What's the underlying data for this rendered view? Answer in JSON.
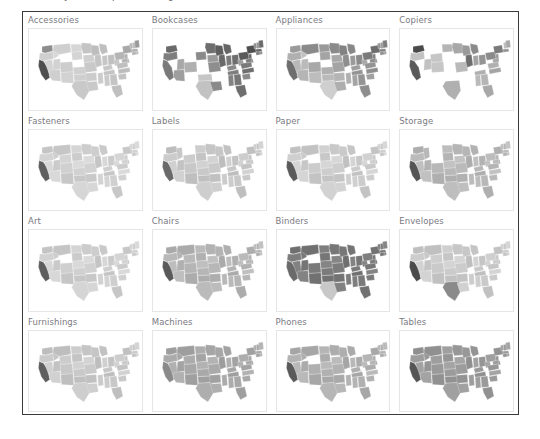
{
  "title_remnant": {
    "fragments": [
      "y",
      "p",
      "g"
    ]
  },
  "grid": {
    "rows": 4,
    "columns": 4,
    "panel_border_color": "#e6e6e8",
    "frame_border_color": "#3a3a3a",
    "label_color": "#7a7a82",
    "background": "#ffffff"
  },
  "chart_data": {
    "type": "heatmap",
    "title": "",
    "subtitle": "",
    "xlabel": "",
    "ylabel": "",
    "layout": "4x4 trellis of US state choropleth maps (small multiples)",
    "legend": "none",
    "grid": false,
    "geography": "United States (contiguous 48 states)",
    "color_scale": {
      "type": "sequential-gray",
      "low": "#e8e8e8",
      "mid": "#b4b4b4",
      "high": "#4a4a4a",
      "absent": "#ffffff",
      "absent_meaning": "no data / state not present in sub-category"
    },
    "categories": [
      "Accessories",
      "Bookcases",
      "Appliances",
      "Copiers",
      "Fasteners",
      "Labels",
      "Paper",
      "Storage",
      "Art",
      "Chairs",
      "Binders",
      "Envelopes",
      "Furnishings",
      "Machines",
      "Phones",
      "Tables"
    ],
    "panels": [
      {
        "label": "Accessories",
        "row": 1,
        "column": 1,
        "coverage": "near-complete",
        "overall_shade": "light",
        "notes": "most states light gray; California dark; Washington medium-dark; Wyoming absent (white); Nebraska light"
      },
      {
        "label": "Bookcases",
        "row": 1,
        "column": 2,
        "coverage": "sparse",
        "overall_shade": "dark",
        "notes": "many western/plains states absent; Washington, Oregon, California dark; Texas light; Midwest and East dark"
      },
      {
        "label": "Appliances",
        "row": 1,
        "column": 3,
        "coverage": "mostly complete",
        "overall_shade": "medium",
        "notes": "California and Montana medium-dark; a few interior states absent; Midwest dark; Southeast medium"
      },
      {
        "label": "Copiers",
        "row": 1,
        "column": 4,
        "coverage": "very sparse",
        "overall_shade": "mixed",
        "notes": "disconnected states only; Washington and California dark; Texas and Florida medium; large gaps in plains and south"
      },
      {
        "label": "Fasteners",
        "row": 2,
        "column": 1,
        "coverage": "near-complete",
        "overall_shade": "light",
        "notes": "California dark; remainder mostly uniform light gray"
      },
      {
        "label": "Labels",
        "row": 2,
        "column": 2,
        "coverage": "near-complete",
        "overall_shade": "light-medium",
        "notes": "California dark; Montana absent; eastern states medium"
      },
      {
        "label": "Paper",
        "row": 2,
        "column": 3,
        "coverage": "complete",
        "overall_shade": "light",
        "notes": "California dark; Wyoming absent; broadly uniform light shading"
      },
      {
        "label": "Storage",
        "row": 2,
        "column": 4,
        "coverage": "complete",
        "overall_shade": "medium",
        "notes": "California dark; Montana/Wyoming absent; eastern half medium gray"
      },
      {
        "label": "Art",
        "row": 3,
        "column": 1,
        "coverage": "near-complete",
        "overall_shade": "light",
        "notes": "California dark; Wyoming absent; mostly light gray"
      },
      {
        "label": "Chairs",
        "row": 3,
        "column": 2,
        "coverage": "complete",
        "overall_shade": "medium",
        "notes": "California dark; interior medium gray; eastern states medium-dark"
      },
      {
        "label": "Binders",
        "row": 3,
        "column": 3,
        "coverage": "complete",
        "overall_shade": "dark",
        "notes": "darkest panel overall; Wyoming absent (white); Texas notably light against dark surroundings"
      },
      {
        "label": "Envelopes",
        "row": 3,
        "column": 4,
        "coverage": "sparse",
        "overall_shade": "light",
        "notes": "California dark; Texas dark; several plains states absent; eastern states light"
      },
      {
        "label": "Furnishings",
        "row": 4,
        "column": 1,
        "coverage": "complete",
        "overall_shade": "light",
        "notes": "California dark; broadly uniform light shading"
      },
      {
        "label": "Machines",
        "row": 4,
        "column": 2,
        "coverage": "sparse",
        "overall_shade": "medium",
        "notes": "several interior states absent; California and Oregon medium-dark; eastern cluster darker"
      },
      {
        "label": "Phones",
        "row": 4,
        "column": 3,
        "coverage": "complete",
        "overall_shade": "medium",
        "notes": "California dark; Wyoming absent; broad medium-gray coverage"
      },
      {
        "label": "Tables",
        "row": 4,
        "column": 4,
        "coverage": "mostly complete",
        "overall_shade": "medium-dark",
        "notes": "California dark; a few plains states absent; eastern half dark"
      }
    ]
  },
  "panel_fills": {
    "Accessories": {
      "WA": "#8d8d8d",
      "OR": "#cfcfcf",
      "CA": "#4f4f4f",
      "NV": "#d4d4d4",
      "ID": "#d8d8d8",
      "MT": "#cfcfcf",
      "WY": "none",
      "UT": "#d2d2d2",
      "AZ": "#cfcfcf",
      "CO": "#cdcdcd",
      "NM": "#d2d2d2",
      "ND": "#d6d6d6",
      "SD": "#d4d4d4",
      "NE": "#ffffff",
      "KS": "#d0d0d0",
      "OK": "#cfcfcf",
      "TX": "#c9c9c9",
      "MN": "#c4c4c4",
      "IA": "#cfcfcf",
      "MO": "#c9c9c9",
      "AR": "#cccccc",
      "LA": "#c9c9c9",
      "WI": "#bdbdbd",
      "IL": "#c4c4c4",
      "MS": "#cccccc",
      "MI": "#bfbfbf",
      "IN": "#c6c6c6",
      "KY": "#c6c6c6",
      "TN": "#c4c4c4",
      "AL": "#cacaca",
      "OH": "#c0c0c0",
      "WV": "#c6c6c6",
      "GA": "#c4c4c4",
      "FL": "#bfbfbf",
      "PA": "#b5b5b5",
      "VA": "#bfbfbf",
      "NC": "#bdbdbd",
      "SC": "#c2c2c2",
      "NY": "#a8a8a8",
      "VT": "#b8b8b8",
      "NH": "#bababa",
      "ME": "#9a9a9a",
      "MA": "#b0b0b0",
      "CT": "#b5b5b5",
      "RI": "#b8b8b8",
      "NJ": "#b0b0b0",
      "DE": "#b5b5b5",
      "MD": "#b5b5b5"
    },
    "Bookcases": {
      "WA": "#6a6a6a",
      "OR": "#7e7e7e",
      "CA": "#7a7a7a",
      "NV": "none",
      "ID": "none",
      "MT": "none",
      "WY": "none",
      "UT": "#a8a8a8",
      "AZ": "#9e9e9e",
      "CO": "#b0b0b0",
      "NM": "none",
      "ND": "none",
      "SD": "#8a8a8a",
      "NE": "none",
      "KS": "none",
      "OK": "#c6c6c6",
      "TX": "#c2c2c2",
      "MN": "#6e6e6e",
      "IA": "#9a9a9a",
      "MO": "#8e8e8e",
      "AR": "none",
      "LA": "#8a8a8a",
      "WI": "#5e5e5e",
      "IL": "#6a6a6a",
      "MS": "none",
      "MI": "#666666",
      "IN": "#7a7a7a",
      "KY": "#8a8a8a",
      "TN": "#7e7e7e",
      "AL": "#828282",
      "OH": "#6e6e6e",
      "WV": "#9e9e9e",
      "GA": "#767676",
      "FL": "#6e6e6e",
      "PA": "#5a5a5a",
      "VA": "#7a7a7a",
      "NC": "#6e6e6e",
      "SC": "#8a8a8a",
      "NY": "#4e4e4e",
      "VT": "#8e8e8e",
      "NH": "#929292",
      "ME": "#6a6a6a",
      "MA": "#666666",
      "CT": "#7e7e7e",
      "RI": "#8a8a8a",
      "NJ": "#6a6a6a",
      "DE": "#8e8e8e",
      "MD": "#7e7e7e"
    },
    "Appliances": {
      "WA": "#9a9a9a",
      "OR": "#b0b0b0",
      "CA": "#6e6e6e",
      "NV": "#b8b8b8",
      "ID": "#c2c2c2",
      "MT": "#8a8a8a",
      "WY": "none",
      "UT": "#bababa",
      "AZ": "#b5b5b5",
      "CO": "#a8a8a8",
      "NM": "#bdbdbd",
      "ND": "#9a9a9a",
      "SD": "#a4a4a4",
      "NE": "none",
      "KS": "#b0b0b0",
      "OK": "#bababa",
      "TX": "#cfcfcf",
      "MN": "#8a8a8a",
      "IA": "#a8a8a8",
      "MO": "#a4a4a4",
      "AR": "#b5b5b5",
      "LA": "#aeaeae",
      "WI": "#828282",
      "IL": "#8e8e8e",
      "MS": "#b0b0b0",
      "MI": "#888888",
      "IN": "#9a9a9a",
      "KY": "#9e9e9e",
      "TN": "#949494",
      "AL": "#a4a4a4",
      "OH": "#8a8a8a",
      "WV": "#a8a8a8",
      "GA": "#949494",
      "FL": "#8e8e8e",
      "PA": "#7a7a7a",
      "VA": "#949494",
      "NC": "#8e8e8e",
      "SC": "#a0a0a0",
      "NY": "#6e6e6e",
      "VT": "#949494",
      "NH": "#9a9a9a",
      "ME": "#7e7e7e",
      "MA": "#828282",
      "CT": "#8e8e8e",
      "RI": "#9a9a9a",
      "NJ": "#828282",
      "DE": "#949494",
      "MD": "#8e8e8e"
    },
    "Copiers": {
      "WA": "#4a4a4a",
      "OR": "#c2c2c2",
      "CA": "#5a5a5a",
      "NV": "none",
      "ID": "none",
      "MT": "none",
      "WY": "#c6c6c6",
      "UT": "#c2c2c2",
      "AZ": "none",
      "CO": "#c6c6c6",
      "NM": "none",
      "ND": "#b5b5b5",
      "SD": "none",
      "NE": "none",
      "KS": "none",
      "OK": "none",
      "TX": "#b0b0b0",
      "MN": "#a8a8a8",
      "IA": "none",
      "MO": "#bababa",
      "AR": "none",
      "LA": "none",
      "WI": "#9a9a9a",
      "IL": "#6e6e6e",
      "MS": "none",
      "MI": "#8a8a8a",
      "IN": "#a4a4a4",
      "KY": "none",
      "TN": "#b0b0b0",
      "AL": "#bababa",
      "OH": "#949494",
      "WV": "none",
      "GA": "#b5b5b5",
      "FL": "#a8a8a8",
      "PA": "#8a8a8a",
      "VA": "#b0b0b0",
      "NC": "#a4a4a4",
      "SC": "none",
      "NY": "#7a7a7a",
      "VT": "none",
      "NH": "#bababa",
      "ME": "#a8a8a8",
      "MA": "#949494",
      "CT": "none",
      "RI": "none",
      "NJ": "#9a9a9a",
      "DE": "none",
      "MD": "#a8a8a8"
    },
    "Fasteners": {
      "CA": "#5e5e5e",
      "default_light": "#d0d0d0"
    },
    "Labels": {
      "CA": "#6a6a6a",
      "MT": "none",
      "default_light": "#c8c8c8"
    },
    "Paper": {
      "CA": "#5a5a5a",
      "WY": "none",
      "default_light": "#cccccc"
    },
    "Storage": {
      "CA": "#555555",
      "MT": "none",
      "WY": "none",
      "default_light": "#b8b8b8"
    },
    "Art": {
      "CA": "#5e5e5e",
      "WY": "none",
      "default_light": "#cfcfcf"
    },
    "Chairs": {
      "CA": "#5a5a5a",
      "default_light": "#b5b5b5"
    },
    "Binders": {
      "CA": "#6a6a6a",
      "WY": "none",
      "TX": "#c8c8c8",
      "default_light": "#7a7a7a"
    },
    "Envelopes": {
      "CA": "#4a4a4a",
      "TX": "#8a8a8a",
      "default_light": "#cacaca"
    },
    "Furnishings": {
      "CA": "#5e5e5e",
      "default_light": "#c8c8c8"
    },
    "Machines": {
      "CA": "#8a8a8a",
      "default_light": "#a8a8a8"
    },
    "Phones": {
      "CA": "#5a5a5a",
      "WY": "none",
      "default_light": "#b0b0b0"
    },
    "Tables": {
      "CA": "#555555",
      "default_light": "#9a9a9a"
    }
  }
}
